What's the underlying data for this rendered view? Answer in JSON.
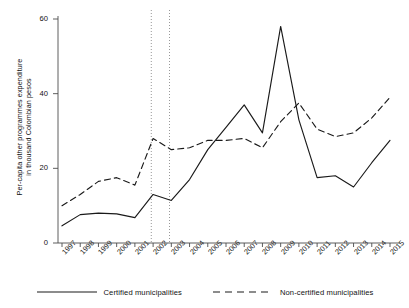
{
  "chart_data": {
    "type": "line",
    "title": "",
    "xlabel": "",
    "ylabel": "Per-capita other programmes expenditure in thousand Colombian pesos",
    "ylabel_line1": "Per-capita other programmes expenditure",
    "ylabel_line2": "in thousand Colombian pesos",
    "x": [
      1997,
      1998,
      1999,
      2000,
      2001,
      2002,
      2003,
      2004,
      2005,
      2006,
      2007,
      2008,
      2009,
      2010,
      2011,
      2012,
      2013,
      2014,
      2015
    ],
    "categories": [
      "1997",
      "1998",
      "1999",
      "2000",
      "2001",
      "2002",
      "2003",
      "2004",
      "2005",
      "2006",
      "2007",
      "2008",
      "2009",
      "2010",
      "2011",
      "2012",
      "2013",
      "2014",
      "2015"
    ],
    "xtick_labels": [
      "1997",
      "1998",
      "1999",
      "2000",
      "2001",
      "2002",
      "2003",
      "2004",
      "2005",
      "2006",
      "2007",
      "2008",
      "2009",
      "2010",
      "2011",
      "2012",
      "2013",
      "2014",
      "2015"
    ],
    "ytick_labels": [
      "0",
      "20",
      "40",
      "60"
    ],
    "yticks": [
      0,
      20,
      40,
      60
    ],
    "ylim": [
      0,
      62
    ],
    "xlim": [
      1997,
      2015
    ],
    "grid": false,
    "legend_position": "bottom",
    "series": [
      {
        "name": "Certified municipalities",
        "style": "solid",
        "color": "#1a1a1a",
        "values": [
          4.6,
          7.6,
          8.0,
          7.8,
          6.8,
          13.0,
          11.4,
          17.0,
          25.0,
          31.0,
          37.0,
          29.5,
          58.0,
          33.0,
          17.5,
          18.0,
          15.0,
          21.5,
          27.5
        ]
      },
      {
        "name": "Non-certified municipalities",
        "style": "dashed",
        "color": "#1a1a1a",
        "values": [
          10.0,
          13.0,
          16.5,
          17.5,
          15.5,
          28.0,
          25.0,
          25.5,
          27.5,
          27.5,
          28.0,
          25.5,
          32.5,
          37.5,
          30.5,
          28.5,
          29.5,
          33.5,
          39.0
        ]
      }
    ],
    "annotations": [
      {
        "type": "vline",
        "x": 2001.9,
        "style": "dotted"
      },
      {
        "type": "vline",
        "x": 2002.9,
        "style": "dotted"
      }
    ]
  },
  "legend": {
    "items": [
      {
        "label": "Certified municipalities",
        "style": "solid"
      },
      {
        "label": "Non-certified municipalities",
        "style": "dashed"
      }
    ]
  }
}
